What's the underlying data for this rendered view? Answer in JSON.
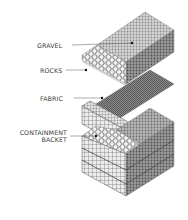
{
  "diagram": {
    "type": "exploded isometric layer diagram",
    "labels": {
      "gravel": "GRAVEL",
      "rocks": "ROCKS",
      "fabric": "FABRIC",
      "containment_line1": "CONTAINMENT",
      "containment_line2": "BACKET"
    },
    "colors": {
      "text": "#3a3a3a",
      "leader": "#555555",
      "gravel_top": "#c9c9c9",
      "gravel_side": "#8a8a8a",
      "rocks": "#f2f2f2",
      "fabric": "#7a7a7a",
      "mesh": "#6a6a6a"
    }
  }
}
